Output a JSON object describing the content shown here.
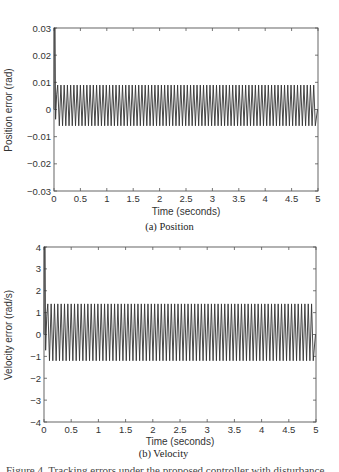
{
  "chart_data": [
    {
      "type": "line",
      "panel": "a",
      "caption": "(a) Position",
      "xlabel": "Time (seconds)",
      "ylabel": "Position error (rad)",
      "xlim": [
        0,
        5
      ],
      "ylim": [
        -0.03,
        0.03
      ],
      "xticks": [
        "0",
        "0.5",
        "1",
        "1.5",
        "2",
        "2.5",
        "3",
        "3.5",
        "4",
        "4.5",
        "5"
      ],
      "yticks": [
        "-0.03",
        "-0.02",
        "-0.01",
        "0",
        "0.01",
        "0.02",
        "0.03"
      ],
      "grid": false,
      "series": [
        {
          "name": "Position error",
          "description": "Initial spike to ~0.03 at t=0, then steady oscillation between ~-0.006 and ~0.009",
          "initial_peak": 0.03,
          "steady_max": 0.009,
          "steady_min": -0.006,
          "approx_cycles": 80
        }
      ]
    },
    {
      "type": "line",
      "panel": "b",
      "caption": "(b) Velocity",
      "xlabel": "Time (seconds)",
      "ylabel": "Velocity error (rad/s)",
      "xlim": [
        0,
        5
      ],
      "ylim": [
        -4,
        4
      ],
      "xticks": [
        "0",
        "0.5",
        "1",
        "1.5",
        "2",
        "2.5",
        "3",
        "3.5",
        "4",
        "4.5",
        "5"
      ],
      "yticks": [
        "-4",
        "-3",
        "-2",
        "-1",
        "0",
        "1",
        "2",
        "3",
        "4"
      ],
      "grid": false,
      "series": [
        {
          "name": "Velocity error",
          "description": "Initial spike to ~4 at t=0, then steady oscillation between ~-1.2 and ~1.4",
          "initial_peak": 4,
          "steady_max": 1.4,
          "steady_min": -1.2,
          "approx_cycles": 80
        }
      ]
    }
  ],
  "figure": {
    "a": {
      "caption": "(a) Position",
      "xlabel": "Time (seconds)",
      "ylabel": "Position error (rad)"
    },
    "b": {
      "caption": "(b) Velocity",
      "xlabel": "Time (seconds)",
      "ylabel": "Velocity error (rad/s)"
    }
  },
  "truncated_text": "Figure 4.  Tracking errors under the proposed controller with disturbance..."
}
